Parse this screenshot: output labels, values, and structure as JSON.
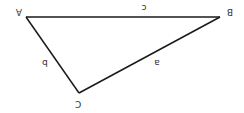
{
  "diagram": {
    "type": "triangle",
    "orientation": "rotated-180",
    "stroke_color": "#1a1a1a",
    "label_color": "#333333",
    "vertices": [
      {
        "id": "A",
        "label": "A",
        "x": 26,
        "y": 17,
        "label_x": 19,
        "label_y": 11
      },
      {
        "id": "B",
        "label": "B",
        "x": 220,
        "y": 17,
        "label_x": 230,
        "label_y": 11
      },
      {
        "id": "C",
        "label": "C",
        "x": 79,
        "y": 93,
        "label_x": 78,
        "label_y": 103
      }
    ],
    "sides": [
      {
        "id": "c",
        "label": "c",
        "from": "A",
        "to": "B",
        "label_x": 144,
        "label_y": 7
      },
      {
        "id": "b",
        "label": "b",
        "from": "A",
        "to": "C",
        "label_x": 45,
        "label_y": 62
      },
      {
        "id": "a",
        "label": "a",
        "from": "B",
        "to": "C",
        "label_x": 157,
        "label_y": 62
      }
    ]
  }
}
